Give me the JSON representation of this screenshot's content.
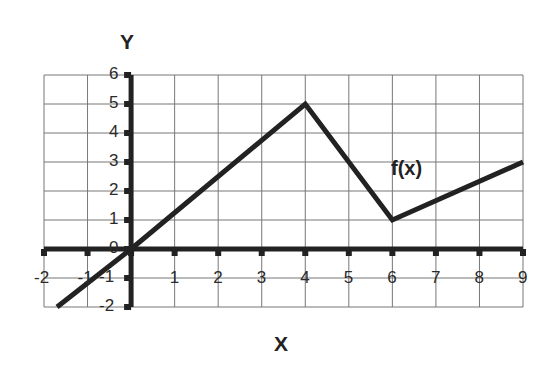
{
  "chart_data": {
    "type": "line",
    "title": "",
    "xlabel": "X",
    "ylabel": "Y",
    "xlim": [
      -2,
      9
    ],
    "ylim": [
      -2,
      6
    ],
    "grid": true,
    "x_ticks": [
      "-2",
      "-1",
      "0",
      "1",
      "2",
      "3",
      "4",
      "5",
      "6",
      "7",
      "8",
      "9"
    ],
    "y_ticks": [
      "-2",
      "-1",
      "0",
      "1",
      "2",
      "3",
      "4",
      "5",
      "6"
    ],
    "series": [
      {
        "name": "f(x)",
        "points": [
          [
            -1.7,
            -2
          ],
          [
            0,
            0
          ],
          [
            4,
            5
          ],
          [
            6,
            1
          ],
          [
            9,
            3
          ]
        ]
      }
    ],
    "annotations": [
      {
        "text": "f(x)",
        "x": 6.5,
        "y": 2.7
      }
    ]
  }
}
